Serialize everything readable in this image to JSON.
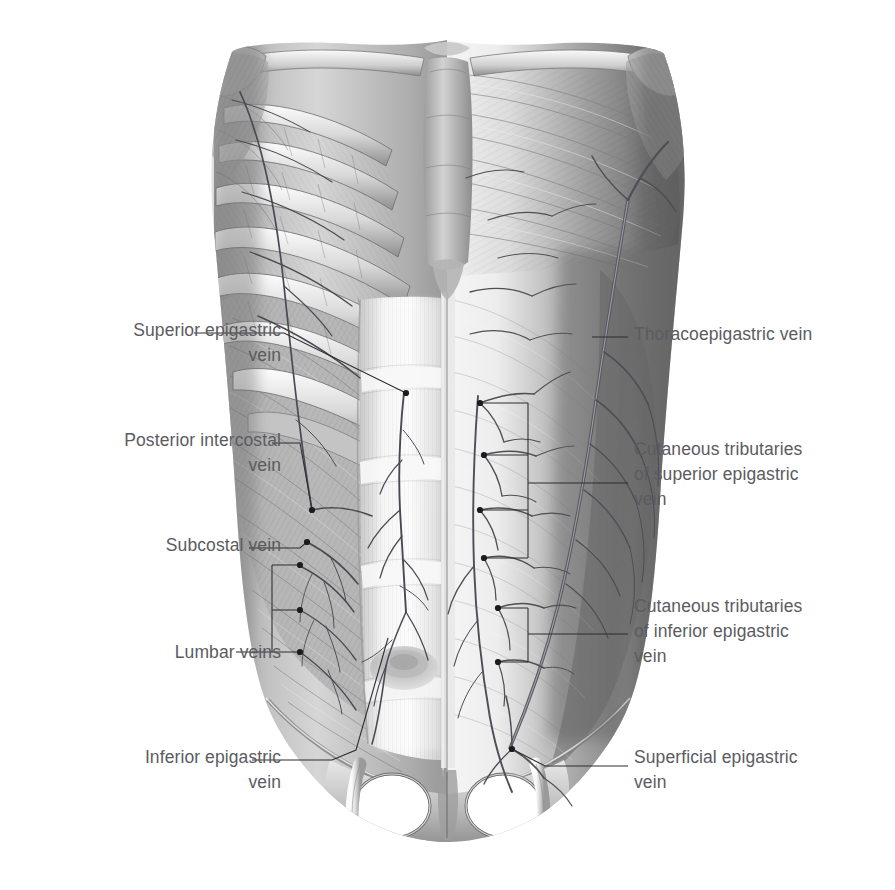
{
  "figure": {
    "background_color": "#ffffff",
    "ink_color": "#2c2c33",
    "label_color": "#5b5b61"
  },
  "labels": {
    "left": [
      {
        "id": "superior-epigastric-vein",
        "text": "Superior epigastric\nvein",
        "x": 96,
        "y": 318,
        "align": "right",
        "width": 185
      },
      {
        "id": "posterior-intercostal-vein",
        "text": "Posterior intercostal\nvein",
        "x": 52,
        "y": 428,
        "align": "right",
        "width": 229
      },
      {
        "id": "subcostal-vein",
        "text": "Subcostal vein",
        "x": 113,
        "y": 533,
        "align": "right",
        "width": 168
      },
      {
        "id": "lumbar-veins",
        "text": "Lumbar veins",
        "x": 123,
        "y": 640,
        "align": "right",
        "width": 158
      },
      {
        "id": "inferior-epigastric-vein",
        "text": "Inferior epigastric\nvein",
        "x": 77,
        "y": 745,
        "align": "right",
        "width": 204
      }
    ],
    "right": [
      {
        "id": "thoracoepigastric-vein",
        "text": "Thoracoepigastric vein",
        "x": 634,
        "y": 322,
        "align": "left",
        "width": 250
      },
      {
        "id": "cutaneous-tributaries-superior-epigastric",
        "text": "Cutaneous tributaries\nof superior epigastric\nvein",
        "x": 634,
        "y": 437,
        "align": "left",
        "width": 232
      },
      {
        "id": "cutaneous-tributaries-inferior-epigastric",
        "text": "Cutaneous tributaries\nof inferior epigastric\nvein",
        "x": 634,
        "y": 594,
        "align": "left",
        "width": 232
      },
      {
        "id": "superficial-epigastric-vein",
        "text": "Superficial epigastric\nvein",
        "x": 634,
        "y": 745,
        "align": "left",
        "width": 229
      }
    ]
  },
  "leaders": {
    "superior_epigastric": {
      "path": "M 194 333 L 284 333 L 406 393",
      "dots": [
        [
          406,
          393
        ]
      ]
    },
    "posterior_intercostal": {
      "path": "M 272 443 L 300 443 L 312 510",
      "dots": [
        [
          312,
          510
        ]
      ]
    },
    "subcostal": {
      "path": "M 249 548 L 300 548 L 307 542",
      "dots": [
        [
          307,
          542
        ]
      ]
    },
    "lumbar_bracket": {
      "path": "M 272 565 L 300 565 M 272 610 L 300 610 M 272 652 L 300 652 M 272 565 L 272 652 M 236 652 L 272 652",
      "dots": [
        [
          300,
          565
        ],
        [
          300,
          610
        ],
        [
          300,
          652
        ]
      ]
    },
    "inferior_epigastric": {
      "path": "M 252 760 L 332 760 L 356 750 L 388 638",
      "dots": []
    },
    "thoracoepigastric": {
      "path": "M 592 337 L 628 337",
      "dots": []
    },
    "cut_sup_bracket": {
      "path": "M 480 403 L 528 403 M 484 455 L 528 455 M 480 510 L 528 510 M 484 558 L 528 558 M 528 403 L 528 558 M 528 483 L 628 483",
      "dots": [
        [
          480,
          403
        ],
        [
          484,
          455
        ],
        [
          480,
          510
        ],
        [
          484,
          558
        ]
      ]
    },
    "cut_inf_bracket": {
      "path": "M 498 608 L 528 608 M 498 662 L 528 662 M 528 608 L 528 662 M 528 634 L 628 634",
      "dots": [
        [
          498,
          608
        ],
        [
          498,
          662
        ]
      ]
    },
    "superficial_epigastric": {
      "path": "M 512 749 L 545 766 L 628 766",
      "dots": [
        [
          512,
          749
        ]
      ]
    }
  }
}
